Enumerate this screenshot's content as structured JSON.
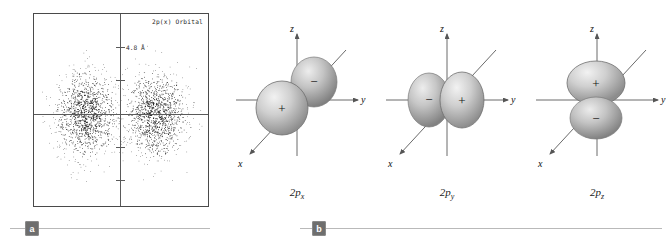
{
  "figure": {
    "panels": [
      {
        "badge": "a",
        "type": "electron-density-dot-plot",
        "orbital_label": "2p(x) Orbital",
        "scale_label": "4.8 Å",
        "tick_count": 4,
        "dot_count": 2600,
        "lobe_centers_norm": [
          0.3,
          0.7
        ],
        "description": "Dot-density representation of the 2p(x) orbital showing two lobes separated by a nodal plane"
      },
      {
        "badge": "b",
        "type": "orbital-diagrams",
        "diagrams": [
          {
            "caption_base": "2p",
            "caption_sub": "x",
            "axis_labels": {
              "x": "x",
              "y": "y",
              "z": "z"
            },
            "lobes": [
              {
                "sign": "+",
                "position": "front-left"
              },
              {
                "sign": "−",
                "position": "back-right"
              }
            ],
            "orientation": "x"
          },
          {
            "caption_base": "2p",
            "caption_sub": "y",
            "axis_labels": {
              "x": "x",
              "y": "y",
              "z": "z"
            },
            "lobes": [
              {
                "sign": "−",
                "position": "left"
              },
              {
                "sign": "+",
                "position": "right"
              }
            ],
            "orientation": "y"
          },
          {
            "caption_base": "2p",
            "caption_sub": "z",
            "axis_labels": {
              "x": "x",
              "y": "y",
              "z": "z"
            },
            "lobes": [
              {
                "sign": "+",
                "position": "top"
              },
              {
                "sign": "−",
                "position": "bottom"
              }
            ],
            "orientation": "z"
          }
        ]
      }
    ],
    "colors": {
      "frame": "#4a4a4a",
      "axis": "#5a5a5a",
      "dot": "#141414",
      "lobe_light": "#e9e9e9",
      "lobe_mid": "#b4b4b4",
      "lobe_dark": "#7e7e7e",
      "rule": "#b9b9b9",
      "badge_bg": "#6e6e6e",
      "badge_text": "#ffffff"
    }
  }
}
